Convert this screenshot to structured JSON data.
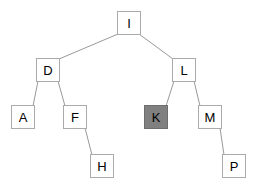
{
  "diagram": {
    "type": "binary-tree",
    "width": 256,
    "height": 190,
    "background_color": "#ffffff",
    "node_border_color": "#aaaaaa",
    "node_fill_color": "#ffffff",
    "node_highlight_fill_color": "#808080",
    "edge_color": "#999999",
    "label_color": "#000000",
    "node_size": 24,
    "nodes": [
      {
        "id": "I",
        "label": "I",
        "x": 117,
        "y": 11,
        "highlighted": false,
        "level": 0
      },
      {
        "id": "D",
        "label": "D",
        "x": 36,
        "y": 58,
        "highlighted": false,
        "level": 1
      },
      {
        "id": "L",
        "label": "L",
        "x": 172,
        "y": 58,
        "highlighted": false,
        "level": 1
      },
      {
        "id": "A",
        "label": "A",
        "x": 11,
        "y": 105,
        "highlighted": false,
        "level": 2
      },
      {
        "id": "F",
        "label": "F",
        "x": 63,
        "y": 105,
        "highlighted": false,
        "level": 2
      },
      {
        "id": "K",
        "label": "K",
        "x": 144,
        "y": 105,
        "highlighted": true,
        "level": 2
      },
      {
        "id": "M",
        "label": "M",
        "x": 198,
        "y": 105,
        "highlighted": false,
        "level": 2
      },
      {
        "id": "H",
        "label": "H",
        "x": 90,
        "y": 154,
        "highlighted": false,
        "level": 3
      },
      {
        "id": "P",
        "label": "P",
        "x": 222,
        "y": 154,
        "highlighted": false,
        "level": 3
      }
    ],
    "edges": [
      {
        "from": "I",
        "to": "D",
        "x1": 118,
        "y1": 34,
        "x2": 59,
        "y2": 59
      },
      {
        "from": "I",
        "to": "L",
        "x1": 139,
        "y1": 34,
        "x2": 173,
        "y2": 59
      },
      {
        "from": "D",
        "to": "A",
        "x1": 38,
        "y1": 81,
        "x2": 33,
        "y2": 106
      },
      {
        "from": "D",
        "to": "F",
        "x1": 58,
        "y1": 81,
        "x2": 65,
        "y2": 106
      },
      {
        "from": "L",
        "to": "K",
        "x1": 174,
        "y1": 81,
        "x2": 166,
        "y2": 106
      },
      {
        "from": "L",
        "to": "M",
        "x1": 194,
        "y1": 81,
        "x2": 200,
        "y2": 106
      },
      {
        "from": "F",
        "to": "H",
        "x1": 85,
        "y1": 128,
        "x2": 92,
        "y2": 155
      },
      {
        "from": "M",
        "to": "P",
        "x1": 220,
        "y1": 128,
        "x2": 224,
        "y2": 155
      }
    ]
  }
}
